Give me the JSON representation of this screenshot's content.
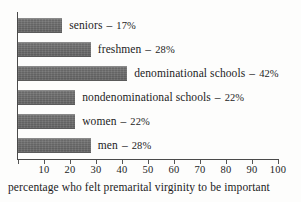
{
  "chart_data": {
    "type": "bar",
    "orientation": "horizontal",
    "title": "",
    "subtitle": "",
    "xlabel": "percentage who felt premarital virginity to be important",
    "ylabel": "",
    "xlim": [
      0,
      100
    ],
    "grid": false,
    "legend": null,
    "categories": [
      "seniors",
      "freshmen",
      "denominational schools",
      "nondenominational schools",
      "women",
      "men"
    ],
    "values": [
      17,
      28,
      42,
      22,
      22,
      28
    ],
    "value_suffix": "%",
    "separator": "–",
    "xticks": [
      0,
      10,
      20,
      30,
      40,
      50,
      60,
      70,
      80,
      90,
      100
    ],
    "xticklabels": [
      "",
      "10",
      "20",
      "30",
      "40",
      "50",
      "60",
      "70",
      "80",
      "90",
      "100"
    ],
    "bar_color": "#6d6d6d",
    "axis_color": "#4a4a4a",
    "background": "#fdfdfc",
    "bars": [
      {
        "label": "seniors",
        "value": 17,
        "value_text": "17%"
      },
      {
        "label": "freshmen",
        "value": 28,
        "value_text": "28%"
      },
      {
        "label": "denominational schools",
        "value": 42,
        "value_text": "42%"
      },
      {
        "label": "nondenominational schools",
        "value": 22,
        "value_text": "22%"
      },
      {
        "label": "women",
        "value": 22,
        "value_text": "22%"
      },
      {
        "label": "men",
        "value": 28,
        "value_text": "28%"
      }
    ]
  },
  "caption": {
    "text": "percentage who felt premarital virginity to be important"
  }
}
